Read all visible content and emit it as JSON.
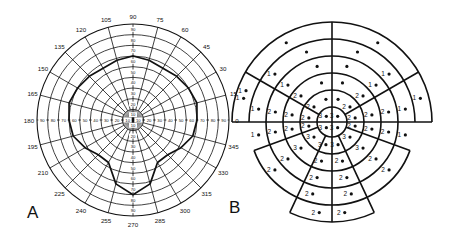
{
  "figure": {
    "panel_a": {
      "label": "A",
      "type": "perimetry-polar-chart",
      "meridian_labels": [
        "0",
        "15",
        "30",
        "45",
        "60",
        "75",
        "90",
        "105",
        "120",
        "135",
        "150",
        "165",
        "180",
        "195",
        "210",
        "225",
        "240",
        "255",
        "270",
        "285",
        "300",
        "315",
        "330",
        "345"
      ],
      "ring_labels": [
        "10",
        "20",
        "30",
        "40",
        "50",
        "60",
        "70",
        "80",
        "90"
      ],
      "isopter_extent_deg": {
        "superior": 60,
        "inferior": 70,
        "nasal": 60,
        "temporal": 90
      }
    },
    "panel_b": {
      "label": "B",
      "type": "segmented-visual-field-scoring-grid",
      "score_values": [
        "1",
        "2",
        "3"
      ]
    }
  }
}
